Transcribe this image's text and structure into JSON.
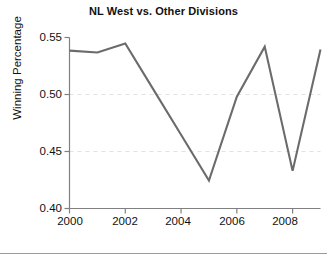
{
  "chart_data": {
    "type": "line",
    "title": "NL West vs. Other Divisions",
    "xlabel": "",
    "ylabel": "Winning Percentage",
    "x": [
      2000,
      2001,
      2002,
      2003,
      2004,
      2005,
      2006,
      2007,
      2008,
      2009
    ],
    "values": [
      0.5385,
      0.5368,
      0.5447,
      0.5047,
      0.4647,
      0.4246,
      0.498,
      0.542,
      0.433,
      0.5395
    ],
    "series": [
      {
        "name": "NL West winning percentage",
        "values": [
          0.5385,
          0.5368,
          0.5447,
          0.5047,
          0.4647,
          0.4246,
          0.498,
          0.542,
          0.433,
          0.5395
        ]
      }
    ],
    "xlim": [
      2000,
      2009
    ],
    "ylim": [
      0.4,
      0.55
    ],
    "yticks": [
      0.4,
      0.45,
      0.5,
      0.55
    ],
    "ytick_labels": [
      "0.40",
      "0.45",
      "0.50",
      "0.55"
    ],
    "xticks": [
      2000,
      2002,
      2004,
      2006,
      2008
    ],
    "xtick_labels": [
      "2000",
      "2002",
      "2004",
      "2006",
      "2008"
    ],
    "grid": true,
    "grid_style": "dashed-horizontal-faint",
    "legend": null,
    "line_color": "#6b6b6b",
    "axis_color": "#808080",
    "grid_color": "#e2e2e2",
    "background": "#ffffff"
  }
}
